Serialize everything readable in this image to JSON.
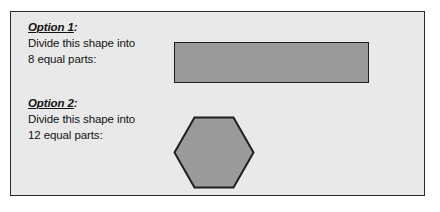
{
  "worksheet": {
    "background_color": "#e9e9e9",
    "border_color": "#2b2b2b",
    "shape_fill_color": "#9a9a9a",
    "shape_stroke_color": "#1f1f1f",
    "options": [
      {
        "heading": "Option 1",
        "heading_colon": ":",
        "instruction_line_1": "Divide this shape into",
        "instruction_line_2": "8 equal parts:",
        "parts": 8,
        "shape": "rectangle"
      },
      {
        "heading": "Option 2",
        "heading_colon": ":",
        "instruction_line_1": "Divide this shape into",
        "instruction_line_2": "12 equal parts:",
        "parts": 12,
        "shape": "hexagon"
      }
    ]
  }
}
